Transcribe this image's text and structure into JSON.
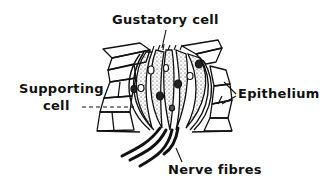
{
  "diagram": {
    "style": "black ink line drawing on white",
    "colors": {
      "background": "#ffffff",
      "ink": "#111111"
    },
    "labels": {
      "gustatory_cell": "Gustatory cell",
      "supporting_cell_line1": "Supporting",
      "supporting_cell_line2": "cell",
      "epithelium": "Epithelium",
      "nerve_fibres": "Nerve fibres"
    },
    "parts": [
      "epithelium-cells",
      "gustatory-cells (stippled)",
      "supporting-cells",
      "nuclei",
      "taste-pore hairs",
      "nerve-fibres"
    ]
  }
}
